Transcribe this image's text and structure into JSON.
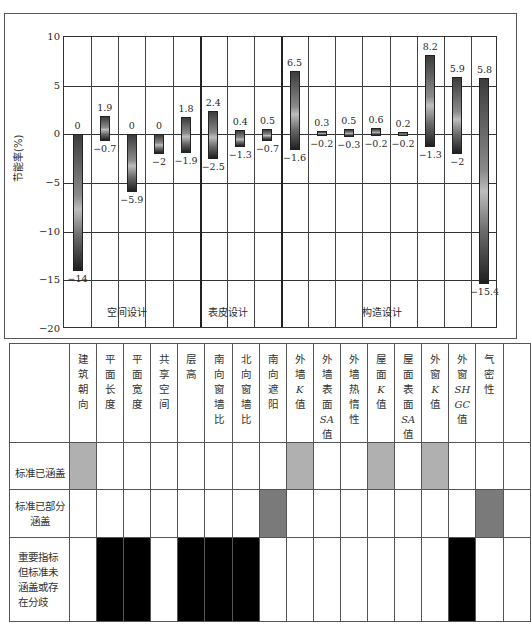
{
  "chart_data": {
    "type": "bar",
    "subtype": "floating range bars (max above / min below)",
    "ylabel": "节能率(%)",
    "ylim": [
      -20,
      10
    ],
    "yticks": [
      10,
      5,
      0,
      -5,
      -10,
      -15,
      -20
    ],
    "grid": true,
    "categories": [
      "建筑朝向",
      "平面长度",
      "平面宽度",
      "共享空间",
      "层高",
      "南向窗墙比",
      "北向窗墙比",
      "南向遮阳",
      "外墙K值",
      "外墙表面SA值",
      "外墙热惰性",
      "屋面K值",
      "屋面表面SA值",
      "外窗K值",
      "外窗SHGC值",
      "气密性"
    ],
    "series": [
      {
        "name": "max",
        "values": [
          0,
          1.9,
          0,
          0,
          1.8,
          2.4,
          0.4,
          0.5,
          6.5,
          0.3,
          0.5,
          0.6,
          0.2,
          8.2,
          5.9,
          5.8
        ]
      },
      {
        "name": "min",
        "values": [
          -14,
          -0.7,
          -5.9,
          -2,
          -1.9,
          -2.5,
          -1.3,
          -0.7,
          -1.6,
          -0.2,
          -0.3,
          -0.2,
          -0.2,
          -1.3,
          -2,
          -15.4
        ]
      }
    ],
    "groups": [
      {
        "label": "空间设计",
        "from": 0,
        "to": 4
      },
      {
        "label": "表皮设计",
        "from": 5,
        "to": 7
      },
      {
        "label": "构造设计",
        "from": 8,
        "to": 15
      }
    ]
  },
  "chart": {
    "ylabel": "节能率(%)",
    "yticks": [
      "10",
      "5",
      "0",
      "−5",
      "−10",
      "−15",
      "−20"
    ],
    "groups": [
      "空间设计",
      "表皮设计",
      "构造设计"
    ],
    "bars": [
      {
        "top": "0",
        "bottom": "−14"
      },
      {
        "top": "1.9",
        "bottom": "−0.7"
      },
      {
        "top": "0",
        "bottom": "−5.9"
      },
      {
        "top": "0",
        "bottom": "−2"
      },
      {
        "top": "1.8",
        "bottom": "−1.9"
      },
      {
        "top": "2.4",
        "bottom": "−2.5"
      },
      {
        "top": "0.4",
        "bottom": "−1.3"
      },
      {
        "top": "0.5",
        "bottom": "−0.7"
      },
      {
        "top": "6.5",
        "bottom": "−1.6"
      },
      {
        "top": "0.3",
        "bottom": "−0.2"
      },
      {
        "top": "0.5",
        "bottom": "−0.3"
      },
      {
        "top": "0.6",
        "bottom": "−0.2"
      },
      {
        "top": "0.2",
        "bottom": "−0.2"
      },
      {
        "top": "8.2",
        "bottom": "−1.3"
      },
      {
        "top": "5.9",
        "bottom": "−2"
      },
      {
        "top": "5.8",
        "bottom": "−15.4"
      }
    ]
  },
  "table": {
    "headers": [
      [
        "建",
        "筑",
        "朝",
        "向"
      ],
      [
        "平",
        "面",
        "长",
        "度"
      ],
      [
        "平",
        "面",
        "宽",
        "度"
      ],
      [
        "共",
        "享",
        "空",
        "间"
      ],
      [
        "层",
        "高"
      ],
      [
        "南",
        "向",
        "窗",
        "墙",
        "比"
      ],
      [
        "北",
        "向",
        "窗",
        "墙",
        "比"
      ],
      [
        "南",
        "向",
        "遮",
        "阳"
      ],
      [
        "外",
        "墙",
        "K",
        "值"
      ],
      [
        "外",
        "墙",
        "表",
        "面",
        "SA",
        "值"
      ],
      [
        "外",
        "墙",
        "热",
        "惰",
        "性"
      ],
      [
        "屋",
        "面",
        "K",
        "值"
      ],
      [
        "屋",
        "面",
        "表",
        "面",
        "SA",
        "值"
      ],
      [
        "外",
        "窗",
        "K",
        "值"
      ],
      [
        "外",
        "窗",
        "SH",
        "GC",
        "值"
      ],
      [
        "气",
        "密",
        "性"
      ]
    ],
    "rows": [
      {
        "label": "标准已涵盖",
        "fill": "#b0b0b0",
        "cells": [
          1,
          0,
          0,
          0,
          0,
          0,
          0,
          0,
          1,
          0,
          0,
          1,
          0,
          1,
          0,
          0
        ]
      },
      {
        "label": "标准已部分涵盖",
        "fill": "#7a7a7a",
        "cells": [
          0,
          0,
          0,
          0,
          0,
          0,
          0,
          1,
          0,
          0,
          0,
          0,
          0,
          0,
          0,
          1
        ]
      },
      {
        "label": "重要指标但标准未涵盖或存在分歧",
        "fill": "#000000",
        "cells": [
          0,
          1,
          1,
          0,
          1,
          1,
          1,
          0,
          0,
          0,
          0,
          0,
          0,
          0,
          1,
          0
        ]
      }
    ],
    "row_labels": {
      "covered": "标准已涵盖",
      "partial_1": "标准已部分",
      "partial_2": "涵盖",
      "missing_1": "重要指标",
      "missing_2": "但标准未",
      "missing_3": "涵盖或存",
      "missing_4": "在分歧"
    }
  }
}
